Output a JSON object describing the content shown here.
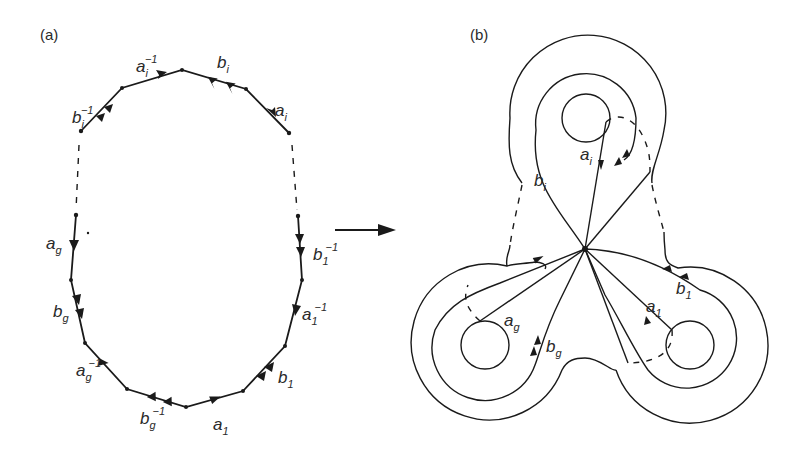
{
  "panels": {
    "a": {
      "label": "(a)"
    },
    "b": {
      "label": "(b)"
    }
  },
  "polygon_a": {
    "edges": [
      {
        "base": "b",
        "sub": "i",
        "sup": "−1",
        "arrows": 2
      },
      {
        "base": "a",
        "sub": "i",
        "sup": "−1",
        "arrows": 1
      },
      {
        "base": "b",
        "sub": "i",
        "sup": "",
        "arrows": 2
      },
      {
        "base": "a",
        "sub": "i",
        "sup": "",
        "arrows": 1
      },
      {
        "base": "b",
        "sub": "1",
        "sup": "−1",
        "arrows": 2
      },
      {
        "base": "a",
        "sub": "1",
        "sup": "−1",
        "arrows": 1
      },
      {
        "base": "b",
        "sub": "1",
        "sup": "",
        "arrows": 2
      },
      {
        "base": "a",
        "sub": "1",
        "sup": "",
        "arrows": 1
      },
      {
        "base": "b",
        "sub": "g",
        "sup": "−1",
        "arrows": 2
      },
      {
        "base": "a",
        "sub": "g",
        "sup": "−1",
        "arrows": 1
      },
      {
        "base": "b",
        "sub": "g",
        "sup": "",
        "arrows": 2
      },
      {
        "base": "a",
        "sub": "g",
        "sup": "",
        "arrows": 1
      }
    ]
  },
  "surface_b": {
    "loops": [
      {
        "base": "a",
        "sub": "i"
      },
      {
        "base": "b",
        "sub": "i"
      },
      {
        "base": "a",
        "sub": "g"
      },
      {
        "base": "b",
        "sub": "g"
      },
      {
        "base": "a",
        "sub": "1"
      },
      {
        "base": "b",
        "sub": "1"
      }
    ],
    "handles": 3
  },
  "transition_arrow": "right-arrow",
  "colors": {
    "ink": "#1a1a1a",
    "background": "#ffffff"
  }
}
